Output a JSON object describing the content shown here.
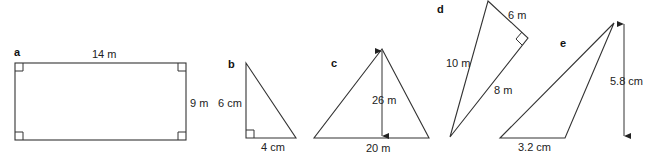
{
  "shapes": {
    "a": {
      "letter": "a",
      "type": "rectangle",
      "width_label": "14 m",
      "height_label": "9 m"
    },
    "b": {
      "letter": "b",
      "type": "right-triangle",
      "height_label": "6 cm",
      "base_label": "4 cm"
    },
    "c": {
      "letter": "c",
      "type": "isosceles-triangle",
      "height_label": "26 m",
      "base_label": "20 m"
    },
    "d": {
      "letter": "d",
      "type": "right-triangle",
      "short_leg_label": "6 m",
      "long_leg_label": "8 m",
      "hypotenuse_label": "10 m"
    },
    "e": {
      "letter": "e",
      "type": "obtuse-triangle",
      "base_label": "3.2 cm",
      "height_label": "5.8 cm"
    }
  }
}
